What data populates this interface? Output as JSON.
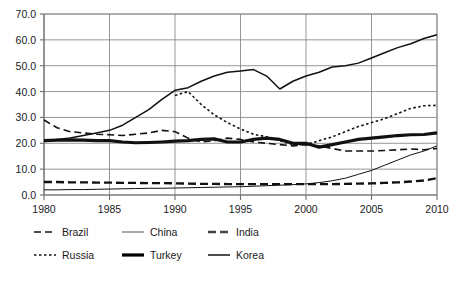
{
  "chart_data": {
    "type": "line",
    "title": "",
    "subtitle": "",
    "xlabel": "",
    "ylabel": "",
    "xlim": [
      1980,
      2010
    ],
    "ylim": [
      0.0,
      70.0
    ],
    "grid": true,
    "legend_position": "bottom",
    "x_tick_labels": [
      "1980",
      "1985",
      "1990",
      "1995",
      "2000",
      "2005",
      "2010"
    ],
    "x_ticks": [
      1980,
      1985,
      1990,
      1995,
      2000,
      2005,
      2010
    ],
    "y_tick_labels": [
      "0.0",
      "10.0",
      "20.0",
      "30.0",
      "40.0",
      "50.0",
      "60.0",
      "70.0"
    ],
    "y_ticks": [
      0.0,
      10.0,
      20.0,
      30.0,
      40.0,
      50.0,
      60.0,
      70.0
    ],
    "x": [
      1980,
      1981,
      1982,
      1983,
      1984,
      1985,
      1986,
      1987,
      1988,
      1989,
      1990,
      1991,
      1992,
      1993,
      1994,
      1995,
      1996,
      1997,
      1998,
      1999,
      2000,
      2001,
      2002,
      2003,
      2004,
      2005,
      2006,
      2007,
      2008,
      2009,
      2010
    ],
    "series": [
      {
        "name": "Brazil",
        "style": "dashed",
        "width": 1.6,
        "color": "#111111",
        "values": [
          29.0,
          26.0,
          24.5,
          24.0,
          23.5,
          23.3,
          23.0,
          23.5,
          24.0,
          25.0,
          24.5,
          22.0,
          20.5,
          21.0,
          22.0,
          21.5,
          20.5,
          20.0,
          19.5,
          19.0,
          19.5,
          19.0,
          18.0,
          17.0,
          17.0,
          17.0,
          17.2,
          17.5,
          17.8,
          17.5,
          18.0
        ]
      },
      {
        "name": "China",
        "style": "solid-thin",
        "width": 1.0,
        "color": "#555555",
        "values": [
          2.0,
          2.0,
          2.1,
          2.1,
          2.2,
          2.3,
          2.4,
          2.5,
          2.6,
          2.6,
          2.7,
          2.8,
          2.9,
          3.0,
          3.1,
          3.2,
          3.4,
          3.6,
          3.8,
          4.0,
          4.3,
          4.8,
          5.5,
          6.5,
          8.0,
          9.5,
          11.5,
          13.5,
          15.5,
          17.0,
          19.0
        ]
      },
      {
        "name": "India",
        "style": "dashed-thick",
        "width": 2.4,
        "color": "#444444",
        "values": [
          5.0,
          5.0,
          4.9,
          4.9,
          4.8,
          4.8,
          4.7,
          4.7,
          4.6,
          4.6,
          4.5,
          4.4,
          4.3,
          4.3,
          4.2,
          4.2,
          4.2,
          4.2,
          4.2,
          4.2,
          4.2,
          4.2,
          4.2,
          4.3,
          4.4,
          4.5,
          4.7,
          4.9,
          5.2,
          5.6,
          6.5
        ]
      },
      {
        "name": "Russia",
        "style": "dotted",
        "width": 1.6,
        "color": "#111111",
        "values": [
          null,
          null,
          null,
          null,
          null,
          null,
          null,
          null,
          null,
          null,
          38.5,
          40.0,
          35.0,
          31.0,
          28.0,
          25.5,
          23.5,
          22.5,
          21.0,
          19.5,
          19.5,
          21.0,
          22.5,
          24.5,
          26.5,
          28.0,
          29.5,
          31.5,
          33.5,
          34.5,
          34.7
        ]
      },
      {
        "name": "Turkey",
        "style": "solid-bold",
        "width": 3.2,
        "color": "#000000",
        "values": [
          21.0,
          21.2,
          21.3,
          21.2,
          21.0,
          21.0,
          20.5,
          20.2,
          20.3,
          20.5,
          20.8,
          21.0,
          21.5,
          21.7,
          20.5,
          20.5,
          21.5,
          22.0,
          21.5,
          20.0,
          20.0,
          18.5,
          19.5,
          20.5,
          21.5,
          22.0,
          22.5,
          23.0,
          23.3,
          23.4,
          24.0
        ]
      },
      {
        "name": "Korea",
        "style": "solid",
        "width": 1.5,
        "color": "#111111",
        "values": [
          21.0,
          21.5,
          22.0,
          23.0,
          24.0,
          25.0,
          27.0,
          30.0,
          33.0,
          37.0,
          40.5,
          41.5,
          44.0,
          46.0,
          47.5,
          48.0,
          48.5,
          46.0,
          41.0,
          44.0,
          46.0,
          47.5,
          49.5,
          50.0,
          51.0,
          53.0,
          55.0,
          57.0,
          58.5,
          60.5,
          62.0
        ]
      }
    ]
  },
  "legend": {
    "rows": [
      [
        {
          "label": "Brazil",
          "style": "dashed"
        },
        {
          "label": "China",
          "style": "solid-thin"
        },
        {
          "label": "India",
          "style": "dashed-thick"
        }
      ],
      [
        {
          "label": "Russia",
          "style": "dotted"
        },
        {
          "label": "Turkey",
          "style": "solid-bold"
        },
        {
          "label": "Korea",
          "style": "solid"
        }
      ]
    ]
  }
}
